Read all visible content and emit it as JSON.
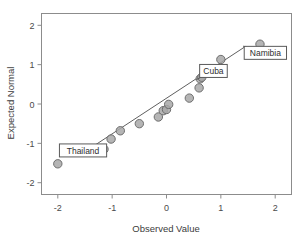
{
  "chart_data": {
    "type": "scatter",
    "title": "",
    "xlabel": "Observed Value",
    "ylabel": "Expected Normal",
    "xlim": [
      -2.3,
      2.3
    ],
    "ylim": [
      -2.3,
      2.3
    ],
    "grid": false,
    "legend": "none",
    "x_ticks": [
      "-2",
      "-1",
      "0",
      "1",
      "2"
    ],
    "x_tick_values": [
      -2,
      -1,
      0,
      1,
      2
    ],
    "y_ticks": [
      "2",
      "1",
      "0",
      "-1",
      "-2"
    ],
    "y_tick_values": [
      2,
      1,
      0,
      -1,
      -2
    ],
    "series": [
      {
        "name": "Cases",
        "x": [
          -2.0,
          -1.15,
          -1.02,
          -0.85,
          -0.5,
          -0.15,
          -0.06,
          0.0,
          0.04,
          0.42,
          0.6,
          0.62,
          0.65,
          1.0,
          1.72
        ],
        "y": [
          -1.52,
          -1.15,
          -0.89,
          -0.68,
          -0.5,
          -0.33,
          -0.17,
          -0.14,
          -0.01,
          0.15,
          0.41,
          0.64,
          0.68,
          1.13,
          1.52
        ]
      }
    ],
    "reference_line": {
      "name": "Normal reference line",
      "x": [
        -1.62,
        1.45
      ],
      "y": [
        -1.32,
        1.46
      ]
    },
    "annotations": [
      {
        "label": "Thailand",
        "point_x": -1.3,
        "point_y": -1.12,
        "box_x": -1.97,
        "box_y": -1.18
      },
      {
        "label": "Cuba",
        "point_x": 0.55,
        "point_y": 0.62,
        "box_x": 0.61,
        "box_y": 0.84
      },
      {
        "label": "Namibia",
        "point_x": 1.41,
        "point_y": 1.47,
        "box_x": 1.43,
        "box_y": 1.3
      }
    ]
  },
  "colors": {
    "point_fill": "#a8a8a8",
    "point_stroke": "#6e6e6e",
    "line": "#5f5f5f",
    "frame": "#8c8c8c",
    "text": "#3a3a3a",
    "background": "#ffffff"
  }
}
